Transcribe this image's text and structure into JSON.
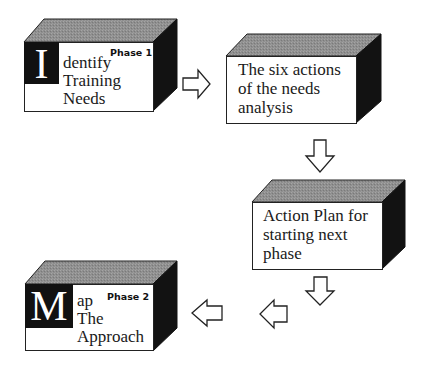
{
  "diagram": {
    "colors": {
      "top_face": "#8f8f8f",
      "side_face": "#121212",
      "front_face": "#ffffff",
      "initial_block": "#111111",
      "arrow_stroke": "#222222"
    },
    "boxes": [
      {
        "id": "identify",
        "initial": "I",
        "phase": "Phase 1",
        "lines": [
          "dentify",
          "Training",
          "Needs"
        ]
      },
      {
        "id": "six-actions",
        "lines": [
          "The six actions",
          "of the needs",
          "analysis"
        ]
      },
      {
        "id": "action-plan",
        "lines": [
          "Action Plan for",
          "starting next",
          "phase"
        ]
      },
      {
        "id": "map",
        "initial": "M",
        "phase": "Phase 2",
        "lines": [
          "ap",
          "The",
          "Approach"
        ]
      }
    ],
    "arrows": [
      {
        "from": "identify",
        "to": "six-actions",
        "direction": "right"
      },
      {
        "from": "six-actions",
        "to": "action-plan",
        "direction": "down"
      },
      {
        "from": "action-plan",
        "to": "map",
        "direction": "down"
      },
      {
        "from": "action-plan",
        "to": "map",
        "direction": "left"
      },
      {
        "from": "action-plan",
        "to": "map",
        "direction": "left"
      }
    ]
  }
}
